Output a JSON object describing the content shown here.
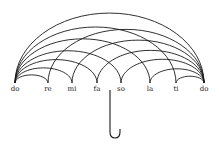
{
  "diagram": {
    "type": "solfege-umbrella",
    "notes": [
      {
        "label": "do",
        "x": 15
      },
      {
        "label": "re",
        "x": 48
      },
      {
        "label": "mi",
        "x": 72
      },
      {
        "label": "fa",
        "x": 97
      },
      {
        "label": "so",
        "x": 121
      },
      {
        "label": "la",
        "x": 150
      },
      {
        "label": "ti",
        "x": 176
      },
      {
        "label": "do",
        "x": 204
      }
    ],
    "baseline_y": 83,
    "handle": {
      "x": 110,
      "top_y": 90,
      "bottom_y": 134
    },
    "stroke_color": "#1a1a1a",
    "background": "#ffffff"
  }
}
